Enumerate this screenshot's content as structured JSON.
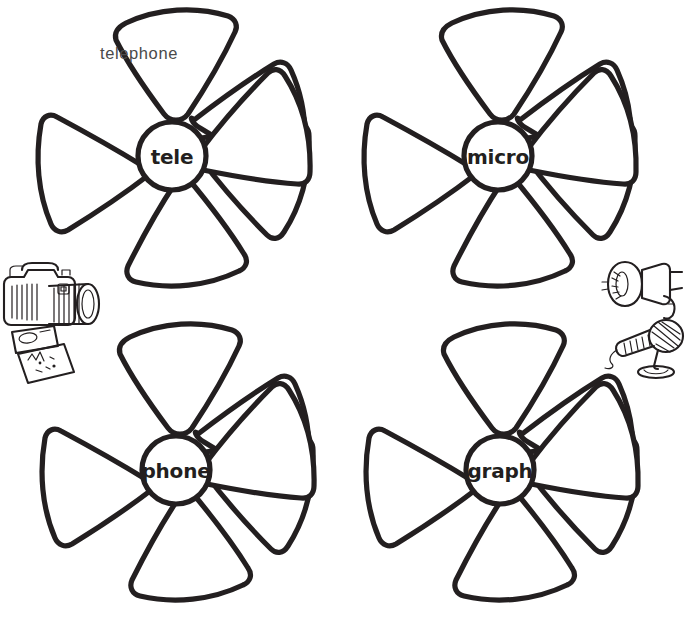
{
  "worksheet": {
    "title": "Word Building Wheels",
    "background_color": "#ffffff",
    "ink_color": "#231f20",
    "example_word_color": "#4a4a4a",
    "wheel_count": 4,
    "petals_per_wheel": 6
  },
  "wheels": [
    {
      "id": "wheel-tele",
      "root": "tele",
      "position": "top-left",
      "center_x": 172,
      "center_y": 156,
      "radius": 150,
      "hub_radius": 34,
      "petals": [
        {
          "index": 0,
          "word": "telephone",
          "filled": true
        },
        {
          "index": 1,
          "word": "",
          "filled": false
        },
        {
          "index": 2,
          "word": "",
          "filled": false
        },
        {
          "index": 3,
          "word": "",
          "filled": false
        },
        {
          "index": 4,
          "word": "",
          "filled": false
        },
        {
          "index": 5,
          "word": "",
          "filled": false
        }
      ]
    },
    {
      "id": "wheel-micro",
      "root": "micro",
      "position": "top-right",
      "center_x": 498,
      "center_y": 156,
      "radius": 150,
      "hub_radius": 34,
      "petals": [
        {
          "index": 0,
          "word": "",
          "filled": false
        },
        {
          "index": 1,
          "word": "",
          "filled": false
        },
        {
          "index": 2,
          "word": "",
          "filled": false
        },
        {
          "index": 3,
          "word": "",
          "filled": false
        },
        {
          "index": 4,
          "word": "",
          "filled": false
        },
        {
          "index": 5,
          "word": "",
          "filled": false
        }
      ]
    },
    {
      "id": "wheel-phone",
      "root": "phone",
      "position": "bottom-left",
      "center_x": 176,
      "center_y": 470,
      "radius": 150,
      "hub_radius": 34,
      "petals": [
        {
          "index": 0,
          "word": "",
          "filled": false
        },
        {
          "index": 1,
          "word": "",
          "filled": false
        },
        {
          "index": 2,
          "word": "",
          "filled": false
        },
        {
          "index": 3,
          "word": "",
          "filled": false
        },
        {
          "index": 4,
          "word": "",
          "filled": false
        },
        {
          "index": 5,
          "word": "",
          "filled": false
        }
      ]
    },
    {
      "id": "wheel-graph",
      "root": "graph",
      "position": "bottom-right",
      "center_x": 500,
      "center_y": 470,
      "radius": 150,
      "hub_radius": 34,
      "petals": [
        {
          "index": 0,
          "word": "",
          "filled": false
        },
        {
          "index": 1,
          "word": "",
          "filled": false
        },
        {
          "index": 2,
          "word": "",
          "filled": false
        },
        {
          "index": 3,
          "word": "",
          "filled": false
        },
        {
          "index": 4,
          "word": "",
          "filled": false
        },
        {
          "index": 5,
          "word": "",
          "filled": false
        }
      ]
    }
  ],
  "illustrations": [
    {
      "id": "camera-illustration",
      "name": "camera-and-photos-icon",
      "depicts": "SLR camera with lens and printed photographs",
      "position": "left-middle",
      "x": 0,
      "y": 258,
      "width": 100,
      "height": 128
    },
    {
      "id": "megaphone-microphone-illustration",
      "name": "megaphone-and-microphone-icon",
      "depicts": "megaphone above a microphone on a stand",
      "position": "right-middle",
      "x": 598,
      "y": 258,
      "width": 100,
      "height": 118
    }
  ]
}
